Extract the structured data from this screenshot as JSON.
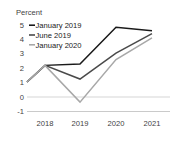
{
  "chart_data": {
    "type": "line",
    "title": "",
    "ylabel": "Percent",
    "xlabel": "",
    "categories": [
      "2018",
      "2019",
      "2020",
      "2021"
    ],
    "x_tick_labels": [
      "2018",
      "2019",
      "2020",
      "2021"
    ],
    "y_tick_labels": [
      "5",
      "4",
      "3",
      "2",
      "1",
      "0",
      "-1"
    ],
    "y_tick_values": [
      5,
      4,
      3,
      2,
      1,
      0,
      -1
    ],
    "ylim": [
      -1,
      5
    ],
    "grid": false,
    "zero_line": true,
    "legend_position": "top-left",
    "series": [
      {
        "name": "January 2019",
        "color": "#1a1a1a",
        "values": [
          2.2,
          2.3,
          4.85,
          4.6
        ],
        "start_value": 1.05
      },
      {
        "name": "June 2019",
        "color": "#4a4a4a",
        "values": [
          2.2,
          1.25,
          3.05,
          4.4
        ],
        "start_value": 1.05
      },
      {
        "name": "January 2020",
        "color": "#a8a8a8",
        "values": [
          2.2,
          -0.35,
          2.6,
          4.1
        ],
        "start_value": 1.05
      }
    ]
  },
  "axis": {
    "ylabel": "Percent",
    "y_ticks": [
      "5",
      "4",
      "3",
      "2",
      "1",
      "0",
      "-1"
    ],
    "x_ticks": [
      "2018",
      "2019",
      "2020",
      "2021"
    ]
  },
  "legend": {
    "items": [
      {
        "label": "January 2019",
        "color": "#1a1a1a"
      },
      {
        "label": "June 2019",
        "color": "#4a4a4a"
      },
      {
        "label": "January 2020",
        "color": "#a8a8a8"
      }
    ]
  },
  "colors": {
    "series_1": "#1a1a1a",
    "series_2": "#4a4a4a",
    "series_3": "#a8a8a8",
    "axis": "#b5b5b5",
    "text": "#3f3f3f",
    "background": "#ffffff"
  }
}
